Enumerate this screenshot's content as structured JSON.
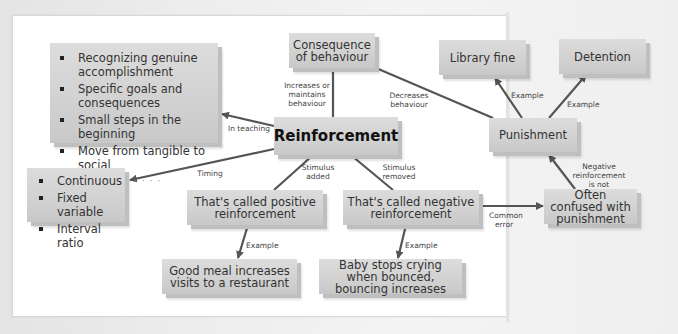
{
  "diagram": {
    "type": "concept-map",
    "colors": {
      "box_fill": "#d2d2d2",
      "box_shadow": "#bfbfbf",
      "line": "#555555",
      "text": "#333333",
      "background": "#ffffff"
    },
    "nodes": {
      "reinforcement": "Reinforcement",
      "consequence": "Consequence of behaviour",
      "teaching_list": {
        "items": [
          "Recognizing genuine accomplishment",
          "Specific goals and consequences",
          "Small steps in the beginning",
          "Move from tangible to social"
        ],
        "more": "· · · · · ·"
      },
      "timing_list": {
        "items": [
          "Continuous",
          "Fixed variable",
          "Interval ratio"
        ]
      },
      "positive": "That's called positive reinforcement",
      "negative": "That's called negative reinforcement",
      "good_meal": "Good meal increases visits to a restaurant",
      "baby": "Baby stops crying when bounced, bouncing increases",
      "confused": "Often confused with punishment",
      "punishment": "Punishment",
      "library_fine": "Library fine",
      "detention": "Detention"
    },
    "edges": {
      "increases": "Increases or maintains behaviour",
      "decreases": "Decreases behaviour",
      "in_teaching": "In teaching",
      "timing": "Timing",
      "stimulus_added": "Stimulus added",
      "stimulus_removed": "Stimulus removed",
      "example_pos": "Example",
      "example_neg": "Example",
      "common_error": "Common error",
      "neg_not": "Negative reinforcement is not",
      "example_fine": "Example",
      "example_detention": "Example"
    }
  }
}
